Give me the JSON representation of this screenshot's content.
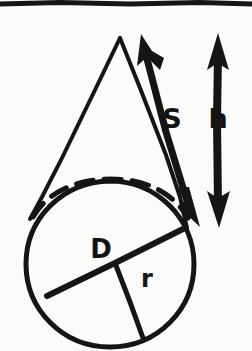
{
  "figure": {
    "background_color": "#fbfbfa",
    "ink_color": "#151515",
    "canvas": {
      "width": 252,
      "height": 351
    }
  },
  "top_rule": {
    "name": "horizontal-rule",
    "color": "#151515",
    "y": 2,
    "thickness": 5
  },
  "labels": [
    {
      "id": "slant",
      "text": "S",
      "meaning": "slant height",
      "x": 172,
      "y": 128,
      "font_size": 27,
      "rotation": 0
    },
    {
      "id": "height",
      "text": "h",
      "meaning": "vertical height",
      "x": 218,
      "y": 128,
      "font_size": 27,
      "rotation": 0
    },
    {
      "id": "diameter",
      "text": "D",
      "meaning": "diameter of base",
      "x": 93,
      "y": 258,
      "font_size": 26,
      "rotation": 0
    },
    {
      "id": "radius",
      "text": "r",
      "meaning": "radius of base",
      "x": 142,
      "y": 287,
      "font_size": 24,
      "rotation": 0
    }
  ],
  "shapes": {
    "cone": {
      "apex": {
        "x": 120,
        "y": 38
      },
      "left_edge_end": {
        "x": 30,
        "y": 218
      },
      "right_edge_end": {
        "x": 186,
        "y": 227
      },
      "stroke_width": 4
    },
    "base_circle": {
      "center": {
        "x": 110,
        "y": 264
      },
      "radius_x": 84,
      "radius_y": 83,
      "stroke_width": 5
    },
    "hidden_arc": {
      "description": "dashed back edge of the elliptical base",
      "center": {
        "x": 110,
        "y": 215
      },
      "radius_x": 78,
      "radius_y": 26,
      "dash_pattern": "17 11",
      "stroke_width": 5
    },
    "diameter_line": {
      "from": {
        "x": 47,
        "y": 296
      },
      "to": {
        "x": 183,
        "y": 229
      },
      "stroke_width": 6
    },
    "radius_line": {
      "from": {
        "x": 115,
        "y": 263
      },
      "to": {
        "x": 143,
        "y": 338
      },
      "stroke_width": 5
    },
    "slant_arrow": {
      "description": "double-headed diagonal arrow along the cone's right slant",
      "tail": {
        "x": 196,
        "y": 222
      },
      "head": {
        "x": 142,
        "y": 39
      },
      "stroke_width": 7,
      "double_headed": true
    },
    "height_arrow": {
      "description": "double-headed vertical arrow showing the cone height",
      "top": {
        "x": 218,
        "y": 42
      },
      "bottom": {
        "x": 218,
        "y": 222
      },
      "stroke_width": 8,
      "double_headed": true
    }
  }
}
